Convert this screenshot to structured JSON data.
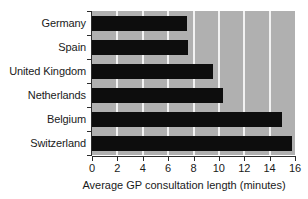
{
  "chart_data": {
    "type": "bar",
    "orientation": "horizontal",
    "title": "",
    "xlabel": "Average GP consultation length (minutes)",
    "ylabel": "",
    "categories": [
      "Germany",
      "Spain",
      "United Kingdom",
      "Netherlands",
      "Belgium",
      "Switzerland"
    ],
    "values": [
      7.5,
      7.6,
      9.5,
      10.3,
      15.0,
      15.8
    ],
    "xlim": [
      0,
      16
    ],
    "xticks": [
      0,
      2,
      4,
      6,
      8,
      10,
      12,
      14,
      16
    ],
    "xticklabels": [
      "0",
      "2",
      "4",
      "6",
      "8",
      "10",
      "12",
      "14",
      "16"
    ],
    "grid": "vertical",
    "legend": "none",
    "colors": {
      "bar": "#0d0d0d",
      "panel_background": "#b0b0b0",
      "gridline": "#f2f2f2",
      "axis": "#2b2b2b",
      "text": "#1a1a1a",
      "figure_background": "#ffffff"
    }
  }
}
